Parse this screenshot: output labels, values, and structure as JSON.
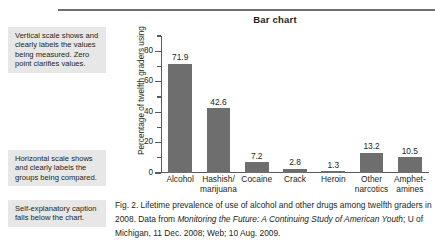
{
  "top_rule": {
    "color": "#6f7073"
  },
  "annotations": [
    {
      "id": "vertical",
      "text": "Vertical scale shows and clearly labels the values being measured. Zero point clarifies values."
    },
    {
      "id": "horizontal",
      "text": "Horizontal scale shows and clearly labels the groups being compared."
    },
    {
      "id": "caption",
      "text": "Self-explanatory caption falls below the chart."
    }
  ],
  "caption": {
    "part1": "Fig. 2. Lifetime prevalence of use of alcohol and other drugs among twelfth graders in 2008. Data from ",
    "italic1": "Monitoring the Future: A Continuing Study of American Youth",
    "part2": "; U of Michigan, 11 Dec. 2008; Web; 10 Aug. 2009."
  },
  "chart_data": {
    "type": "bar",
    "title": "Bar chart",
    "xlabel": "",
    "ylabel": "Percentage of twelfth graders using",
    "ylim": [
      0,
      90
    ],
    "yticks": [
      0,
      20,
      40,
      60,
      80
    ],
    "ytick_labels": [
      "0",
      "20",
      "40",
      "60",
      "80"
    ],
    "minor_ticks": [
      10,
      30,
      50,
      70,
      90
    ],
    "grid": false,
    "legend": false,
    "bar_color": "#6e6e6e",
    "categories": [
      "Alcohol",
      "Hashish/ marijuana",
      "Cocaine",
      "Crack",
      "Heroin",
      "Other narcotics",
      "Amphet- amines"
    ],
    "category_lines": [
      [
        "Alcohol"
      ],
      [
        "Hashish/",
        "marijuana"
      ],
      [
        "Cocaine"
      ],
      [
        "Crack"
      ],
      [
        "Heroin"
      ],
      [
        "Other",
        "narcotics"
      ],
      [
        "Amphet-",
        "amines"
      ]
    ],
    "values": [
      71.9,
      42.6,
      7.2,
      2.8,
      1.3,
      13.2,
      10.5
    ],
    "value_labels": [
      "71.9",
      "42.6",
      "7.2",
      "2.8",
      "1.3",
      "13.2",
      "10.5"
    ]
  }
}
